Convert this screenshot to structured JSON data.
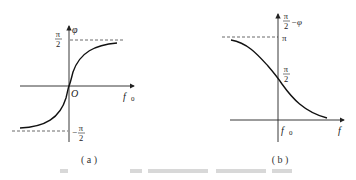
{
  "panels": [
    {
      "id": "a",
      "caption": "( a )",
      "y_axis_label": "φ",
      "x_axis_label": "f",
      "x_axis_subscript": "0",
      "origin_label": "O",
      "top_tick": {
        "num": "π",
        "den": "2"
      },
      "bottom_tick": {
        "sign": "−",
        "num": "π",
        "den": "2"
      },
      "curve": "phase φ rising from −π/2 to +π/2 through origin"
    },
    {
      "id": "b",
      "caption": "( b )",
      "y_axis_label": {
        "num": "π",
        "den": "2",
        "suffix": "−φ"
      },
      "x_axis_label": "f",
      "x_tick_label": "f",
      "x_tick_subscript": "0",
      "top_tick": "π",
      "mid_tick": {
        "num": "π",
        "den": "2"
      },
      "curve": "π/2 − φ falling from π to 0, crossing π/2 at f0"
    }
  ],
  "colors": {
    "line": "#1a1a1a",
    "dash": "#444444",
    "background": "#ffffff"
  }
}
